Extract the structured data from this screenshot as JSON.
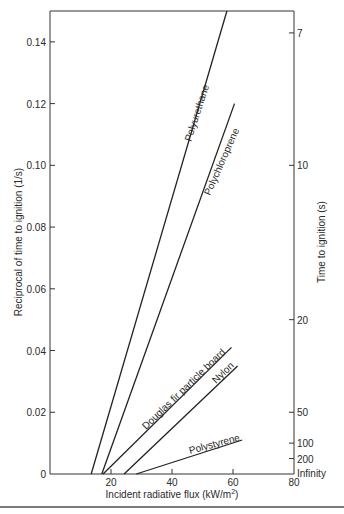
{
  "chart_data": {
    "type": "line",
    "title": "",
    "xlabel": "Incident radiative flux (kW/m²)",
    "ylabel": "Reciprocal of time to ignition (1/s)",
    "y2label": "Time to ignition (s)",
    "xlim": [
      0,
      80
    ],
    "ylim": [
      0,
      0.15
    ],
    "grid": false,
    "legend": "inline labels",
    "x_ticks": [
      20,
      40,
      60,
      80
    ],
    "y_ticks": [
      {
        "value": 0,
        "label": "0"
      },
      {
        "value": 0.02,
        "label": "0.02"
      },
      {
        "value": 0.04,
        "label": "0.04"
      },
      {
        "value": 0.06,
        "label": "0.06"
      },
      {
        "value": 0.08,
        "label": "0.08"
      },
      {
        "value": 0.1,
        "label": "0.10"
      },
      {
        "value": 0.12,
        "label": "0.12"
      },
      {
        "value": 0.14,
        "label": "0.14"
      }
    ],
    "y2_ticks": [
      {
        "value": 0.1429,
        "label": "7"
      },
      {
        "value": 0.1,
        "label": "10"
      },
      {
        "value": 0.05,
        "label": "20"
      },
      {
        "value": 0.02,
        "label": "50"
      },
      {
        "value": 0.01,
        "label": "100"
      },
      {
        "value": 0.005,
        "label": "200"
      },
      {
        "value": 0,
        "label": "Infinity"
      }
    ],
    "series": [
      {
        "name": "Polyurethane",
        "x": [
          13.5,
          58
        ],
        "y": [
          0,
          0.15
        ]
      },
      {
        "name": "Polychloroprene",
        "x": [
          17,
          60.5
        ],
        "y": [
          0,
          0.12
        ]
      },
      {
        "name": "Douglas fir particle board",
        "x": [
          17.4,
          59.5
        ],
        "y": [
          0,
          0.041
        ]
      },
      {
        "name": "Nylon",
        "x": [
          24.3,
          61.5
        ],
        "y": [
          0,
          0.035
        ]
      },
      {
        "name": "Polystyrene",
        "x": [
          28.3,
          63
        ],
        "y": [
          0,
          0.011
        ]
      }
    ]
  },
  "labels": {
    "polyurethane": "Polyurethane",
    "polychloroprene": "Polychloroprene",
    "douglas": "Douglas fir particle board",
    "nylon": "Nylon",
    "polystyrene": "Polystyrene",
    "xlabel_main": "Incident radiative flux (kW/m",
    "xlabel_sup": "2",
    "xlabel_end": ")",
    "ylabel": "Reciprocal of time to ignition (1/s)",
    "y2label": "Time to ignition (s)"
  }
}
